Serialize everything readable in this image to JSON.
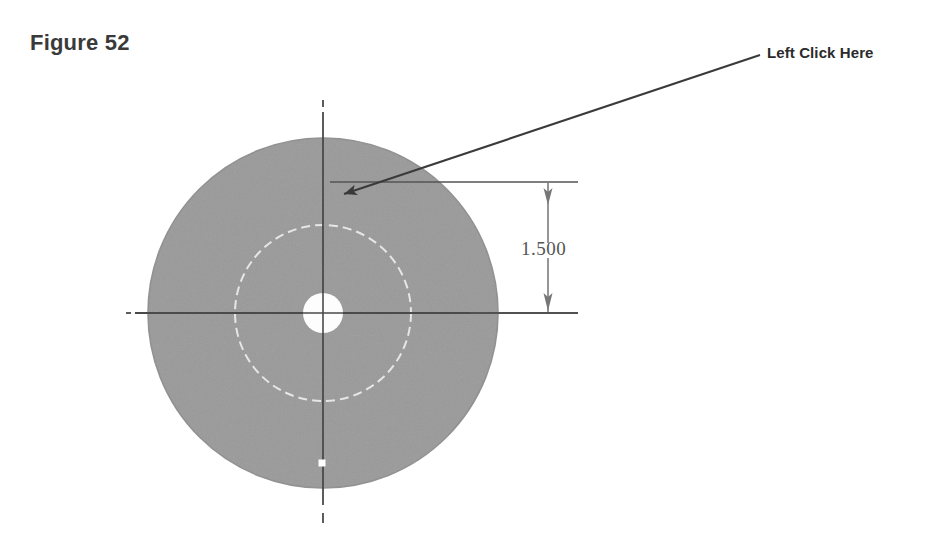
{
  "figure": {
    "title": "Figure 52",
    "background_color": "#ffffff"
  },
  "callout": {
    "label": "Left Click Here",
    "leader_color": "#333333",
    "arrow_target_x": 332,
    "arrow_target_y": 197,
    "leader_start_x": 760,
    "leader_start_y": 55
  },
  "dimension": {
    "value": "1.500",
    "line_color": "#555555",
    "orientation": "vertical",
    "top_y": 182,
    "bottom_y": 315,
    "line_x": 548
  },
  "part": {
    "name": "circular-disc",
    "fill_color": "#9a9a9a",
    "edge_color": "#8d8d8d",
    "center_x": 323,
    "center_y": 313,
    "outer_radius": 175,
    "inner_circle_radius": 88,
    "inner_circle_color": "#e8e8e8",
    "bore_radius": 20,
    "bore_color": "#fdfdfd",
    "centerline_color": "#4a4a4a",
    "marker_color": "#ffffff",
    "marker_x": 322,
    "marker_y": 463,
    "marker_size": 7
  },
  "icons": {
    "arrow": "left-arrowhead-icon",
    "dimension_arrow_top": "down-arrowhead-icon",
    "dimension_arrow_bottom": "down-arrowhead-icon"
  }
}
